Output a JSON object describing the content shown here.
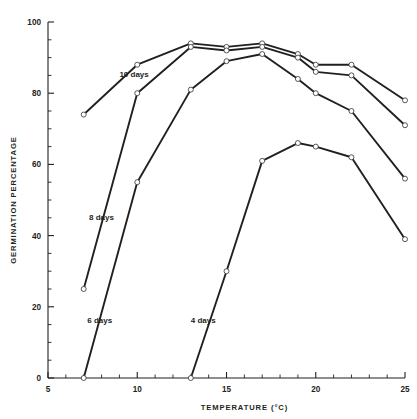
{
  "chart_data": {
    "type": "line",
    "title": "",
    "xlabel": "TEMPERATURE (°C)",
    "ylabel": "GERMINATION PERCENTAGE",
    "xlim": [
      5,
      25
    ],
    "ylim": [
      0,
      100
    ],
    "x_ticks": [
      5,
      10,
      15,
      20,
      25
    ],
    "x_tick_labels": [
      "5",
      "10",
      "15",
      "20",
      "25"
    ],
    "x_minor_step": 1,
    "y_ticks": [
      0,
      20,
      40,
      60,
      80,
      100
    ],
    "y_tick_labels": [
      "0",
      "20",
      "40",
      "60",
      "80",
      "100"
    ],
    "y_minor_step": 5,
    "grid": false,
    "legend": "inline-labels",
    "marker": "open-circle",
    "line_color": "#231f20",
    "marker_fill": "#ffffff",
    "series": [
      {
        "name": "10 days",
        "label": "10 days",
        "label_x": 9.0,
        "label_y": 84.5,
        "x": [
          7,
          10,
          13,
          15,
          17,
          19,
          20,
          22,
          25
        ],
        "y": [
          74,
          88,
          94,
          93,
          94,
          91,
          88,
          88,
          78
        ]
      },
      {
        "name": "8 days",
        "label": "8 days",
        "label_x": 7.3,
        "label_y": 44.5,
        "x": [
          7,
          10,
          13,
          15,
          17,
          19,
          20,
          22,
          25
        ],
        "y": [
          25,
          80,
          93,
          92,
          93,
          90,
          86,
          85,
          71
        ]
      },
      {
        "name": "6 days",
        "label": "6 days",
        "label_x": 7.2,
        "label_y": 15.5,
        "x": [
          7,
          10,
          13,
          15,
          17,
          19,
          20,
          22,
          25
        ],
        "y": [
          0,
          55,
          81,
          89,
          91,
          84,
          80,
          75,
          56
        ]
      },
      {
        "name": "4 days",
        "label": "4 days",
        "label_x": 13.0,
        "label_y": 15.5,
        "x": [
          13,
          15,
          17,
          19,
          20,
          22,
          25
        ],
        "y": [
          0,
          30,
          61,
          66,
          65,
          62,
          39
        ]
      }
    ]
  }
}
